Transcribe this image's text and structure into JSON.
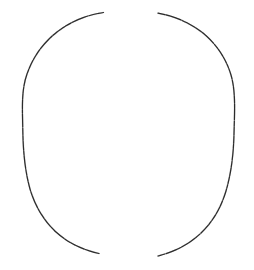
{
  "canvas": {
    "width": 254,
    "height": 270,
    "background_color": "#ffffff",
    "title": "Hand-drawn open ellipse sketch"
  },
  "drawing": {
    "style": "pencil-sketch",
    "stroke_color": "#2b2b2b",
    "stroke_color_light": "#555555",
    "stroke_width": 1.2,
    "description": "Two thin hand-drawn arcs forming an open ellipse with gaps at the top and bottom",
    "shape_type": "open-ellipse",
    "ellipse": {
      "center_x": 128,
      "center_y": 134,
      "radius_x": 106,
      "radius_y": 122
    },
    "gaps": [
      {
        "name": "top-gap",
        "x_start": 103,
        "x_end": 158,
        "y": 12
      },
      {
        "name": "bottom-gap",
        "x_start": 99,
        "x_end": 158,
        "y": 255
      }
    ],
    "strokes": [
      {
        "name": "left-arc",
        "start": [
          103,
          12
        ],
        "end": [
          99,
          253
        ],
        "path": "M 103.5 12.5 C 86 15 70 22 57 32 C 43 43 33 57 27 74 C 21 91 22.5 110 22.8 131 C 23.2 152 25 171 30 189 C 35 206 44 221 56 232 C 68 243 83 250 99 253.5"
      },
      {
        "name": "right-arc",
        "start": [
          158,
          13
        ],
        "end": [
          158,
          256
        ],
        "path": "M 158 13.2 C 175 16 190 23 203 33 C 216 44 226 58 231 75 C 236 92 234.5 113 234 134 C 233.5 155 231 174 226 191 C 221 208 212 223 200 234 C 188 245 174 252 158 256"
      }
    ]
  },
  "meta": {
    "rendered_elements": 2,
    "foreground_elements_label": "arcs"
  }
}
